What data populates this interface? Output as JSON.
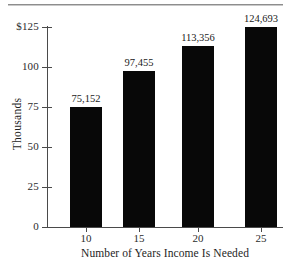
{
  "chart_data": {
    "type": "bar",
    "title": "",
    "subtitle": "",
    "xlabel": "Number of Years Income Is Needed",
    "ylabel": "Thousands",
    "categories": [
      "10",
      "15",
      "20",
      "25"
    ],
    "values": [
      75152,
      97455,
      113356,
      124693
    ],
    "value_labels": [
      "75,152",
      "97,455",
      "113,356",
      "124,693"
    ],
    "series": [
      {
        "name": "Income Needed",
        "values": [
          75152,
          97455,
          113356,
          124693
        ],
        "color": "#080808"
      }
    ],
    "ylim": [
      0,
      125
    ],
    "y_unit_scale": 1000,
    "y_ticks": [
      0,
      25,
      50,
      75,
      100,
      125
    ],
    "y_tick_labels": [
      "0",
      "25",
      "50",
      "75",
      "100",
      "$125"
    ],
    "x_tick_labels": [
      "10",
      "15",
      "20",
      "25"
    ],
    "grid": false,
    "legend": false,
    "legend_position": "none",
    "bar_color": "#080808",
    "axis_color": "#4a4a4a",
    "text_color": "#1e1e1e",
    "background_color": "#ffffff",
    "rule_color": "#8d8d8d"
  },
  "axes": {
    "y": {
      "title": "Thousands",
      "ticks": [
        {
          "label": "$125",
          "value": 125
        },
        {
          "label": "100",
          "value": 100
        },
        {
          "label": "75",
          "value": 75
        },
        {
          "label": "50",
          "value": 50
        },
        {
          "label": "25",
          "value": 25
        },
        {
          "label": "0",
          "value": 0
        }
      ]
    },
    "x": {
      "title": "Number of Years Income Is Needed",
      "ticks": [
        {
          "label": "10"
        },
        {
          "label": "15"
        },
        {
          "label": "20"
        },
        {
          "label": "25"
        }
      ]
    }
  },
  "bars": [
    {
      "category": "10",
      "label": "75,152",
      "value": 75152
    },
    {
      "category": "15",
      "label": "97,455",
      "value": 97455
    },
    {
      "category": "20",
      "label": "113,356",
      "value": 113356
    },
    {
      "category": "25",
      "label": "124,693",
      "value": 124693
    }
  ]
}
